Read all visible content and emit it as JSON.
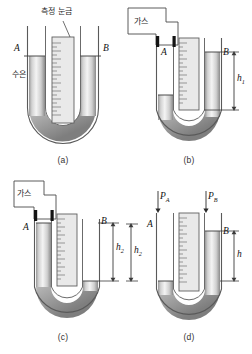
{
  "figure": {
    "title_alt": "U-tube manometer diagrams",
    "panels": [
      {
        "id": "a",
        "caption": "(a)",
        "labels": {
          "left_tube": "A",
          "right_tube": "B",
          "scale_note": "측정 눈금",
          "liquid_note": "수은"
        },
        "mercury_level_left": "equal",
        "mercury_level_right": "equal",
        "gas_attached": false,
        "height_label": ""
      },
      {
        "id": "b",
        "caption": "(b)",
        "labels": {
          "left_tube": "A",
          "right_tube": "B",
          "gas_note": "가스",
          "height_label": "h",
          "height_sub": "1"
        },
        "mercury_level_left": "low",
        "mercury_level_right": "high",
        "gas_attached": true
      },
      {
        "id": "c",
        "caption": "(c)",
        "labels": {
          "left_tube": "A",
          "right_tube": "B",
          "gas_note": "가스",
          "height_label": "h",
          "height_sub": "2"
        },
        "mercury_level_left": "high",
        "mercury_level_right": "low",
        "gas_attached": true
      },
      {
        "id": "d",
        "caption": "(d)",
        "labels": {
          "left_tube": "A",
          "right_tube": "B",
          "pressure_left": "P",
          "pressure_left_sub": "A",
          "pressure_right": "P",
          "pressure_right_sub": "B",
          "height_left": "h",
          "height_left_sub": "2",
          "height_right": "h",
          "height_right_sub": ""
        },
        "mercury_level_left": "low",
        "mercury_level_right": "high",
        "gas_attached": false
      }
    ],
    "colors": {
      "outline": "#4a4a4a",
      "mercury_light": "#fbfbfb",
      "mercury_mid": "#d9d9d9",
      "mercury_dark": "#8e8e8e",
      "scale_fill": "#e6e6e6",
      "stopper": "#141414",
      "background": "#ffffff"
    }
  }
}
